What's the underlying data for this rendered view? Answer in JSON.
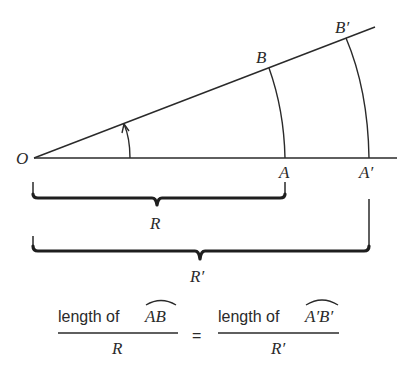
{
  "diagram": {
    "points": {
      "origin": "O",
      "b": "B",
      "b_prime": "B′",
      "a": "A",
      "a_prime": "A′"
    },
    "braces": {
      "inner_radius": "R",
      "outer_radius": "R′"
    },
    "equation": {
      "left_numerator_text": "length of",
      "left_arc": "AB",
      "left_denominator": "R",
      "equals": "=",
      "right_numerator_text": "length of",
      "right_arc": "A′B′",
      "right_denominator": "R′"
    },
    "colors": {
      "ink": "#2a2a2a",
      "background": "#ffffff"
    }
  }
}
